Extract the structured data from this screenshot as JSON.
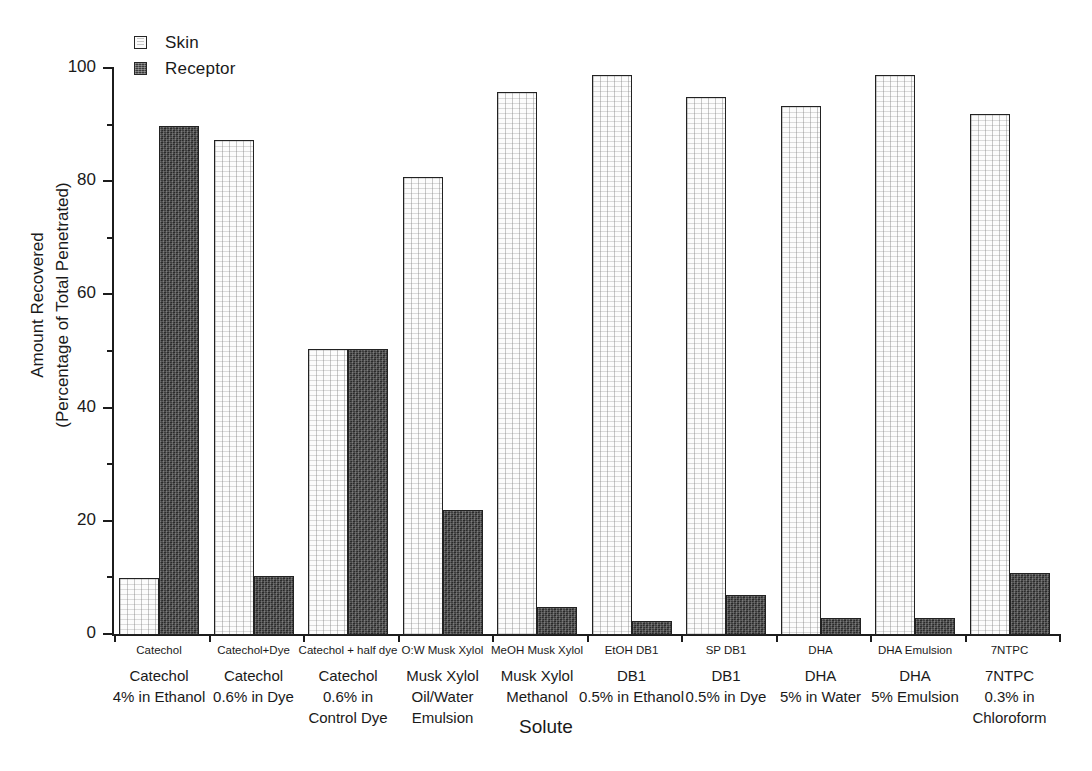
{
  "chart_data": {
    "type": "bar",
    "title": "",
    "xlabel": "Solute",
    "ylabel_line1": "Amount Recovered",
    "ylabel_line2": "(Percentage of Total Penetrated)",
    "ylim": [
      0,
      100
    ],
    "yticks": [
      0,
      20,
      40,
      60,
      80,
      100
    ],
    "yticks_minor": [
      10,
      30,
      50,
      70,
      90
    ],
    "grid": false,
    "legend_position": "top-left",
    "categories": [
      "Catechol",
      "Catechol+Dye",
      "Catechol + half dye",
      "O:W Musk Xylol",
      "MeOH Musk Xylol",
      "EtOH DB1",
      "SP DB1",
      "DHA",
      "DHA Emulsion",
      "7NTPC"
    ],
    "category_descriptions": [
      "Catechol\n4% in Ethanol",
      "Catechol\n0.6% in Dye",
      "Catechol\n0.6% in\nControl Dye",
      "Musk Xylol\nOil/Water\nEmulsion",
      "Musk Xylol\nMethanol",
      "DB1\n0.5% in Ethanol",
      "DB1\n0.5% in Dye",
      "DHA\n5% in Water",
      "DHA\n5% Emulsion",
      "7NTPC\n0.3% in\nChloroform"
    ],
    "series": [
      {
        "name": "Skin",
        "color": "#fcfcfc",
        "values": [
          10,
          87.5,
          50.5,
          81,
          96,
          99,
          95,
          93.5,
          99,
          92
        ]
      },
      {
        "name": "Receptor",
        "color": "#3c3c3c",
        "values": [
          90,
          10.5,
          50.5,
          22,
          5,
          2.5,
          7,
          3,
          3,
          11
        ]
      }
    ]
  },
  "legend": {
    "items": [
      {
        "label": "Skin",
        "swatch": "skin-swatch-icon"
      },
      {
        "label": "Receptor",
        "swatch": "receptor-swatch-icon"
      }
    ]
  },
  "axes": {
    "y_title_line1": "Amount Recovered",
    "y_title_line2": "(Percentage of Total Penetrated)",
    "x_title": "Solute",
    "y_tick_labels": [
      "100",
      "80",
      "60",
      "40",
      "20",
      "0"
    ]
  }
}
